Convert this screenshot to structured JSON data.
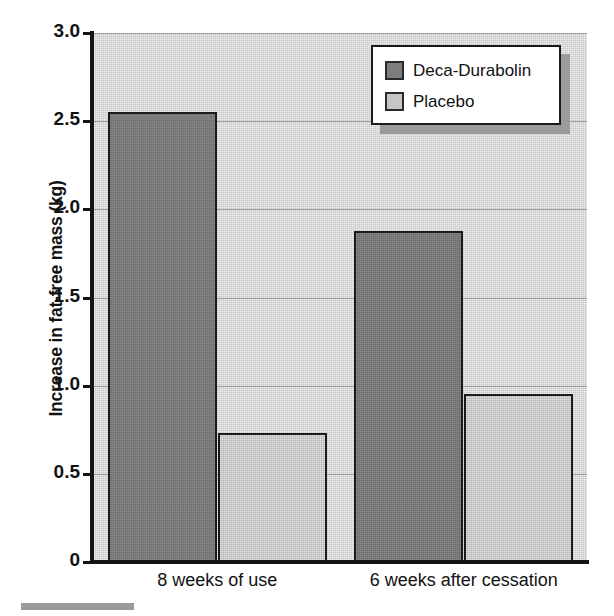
{
  "chart_data": {
    "type": "bar",
    "title": "",
    "subtitle": "",
    "xlabel": "",
    "ylabel": "Increase in fat-free mass (kg)",
    "categories": [
      "8 weeks of use",
      "6 weeks after cessation"
    ],
    "series": [
      {
        "name": "Deca-Durabolin",
        "values": [
          2.55,
          1.88
        ],
        "color": "#787878"
      },
      {
        "name": "Placebo",
        "values": [
          0.73,
          0.95
        ],
        "color": "#c2c2c2"
      }
    ],
    "ylim": [
      0,
      3.0
    ],
    "ytick_values": [
      0,
      0.5,
      1.0,
      1.5,
      2.0,
      2.5,
      3.0
    ],
    "ytick_labels": [
      "0",
      "0.5",
      "1.0",
      "1.5",
      "2.0",
      "2.5",
      "3.0"
    ],
    "grid": true,
    "grid_axis": "y",
    "legend_position": "top-right",
    "plot_background": "#d4d4d4",
    "bar_outline_color": "#1b1b1b"
  },
  "legend": {
    "entries": [
      {
        "label": "Deca-Durabolin"
      },
      {
        "label": "Placebo"
      }
    ]
  },
  "axes": {
    "y_title": "Increase in fat-free mass (kg)"
  },
  "footer": {
    "rule_color": "#9a9a9a"
  }
}
